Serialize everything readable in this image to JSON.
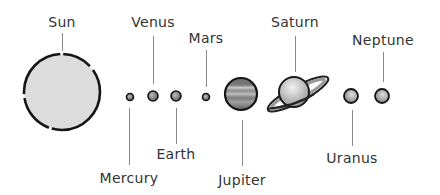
{
  "diagram": {
    "title": "",
    "planets": [
      {
        "id": "sun",
        "label": "Sun",
        "cx": 62,
        "cy": 92,
        "r": 38,
        "fill": "#dcdcdc",
        "label_pos": "top",
        "label_x": 62,
        "label_y": 14,
        "line_y1": 33,
        "line_y2": 51
      },
      {
        "id": "mercury",
        "label": "Mercury",
        "cx": 130,
        "cy": 97,
        "r": 3.5,
        "fill": "#777777",
        "label_pos": "bottom",
        "label_x": 129,
        "label_y": 170,
        "line_y1": 108,
        "line_y2": 165
      },
      {
        "id": "venus",
        "label": "Venus",
        "cx": 153,
        "cy": 96,
        "r": 5,
        "fill": "#666666",
        "label_pos": "top",
        "label_x": 153,
        "label_y": 14,
        "line_y1": 36,
        "line_y2": 84
      },
      {
        "id": "earth",
        "label": "Earth",
        "cx": 176,
        "cy": 96,
        "r": 5,
        "fill": "#6a6a6a",
        "label_pos": "bottom",
        "label_x": 176,
        "label_y": 146,
        "line_y1": 108,
        "line_y2": 144
      },
      {
        "id": "mars",
        "label": "Mars",
        "cx": 206,
        "cy": 97,
        "r": 3.5,
        "fill": "#888888",
        "label_pos": "top",
        "label_x": 206,
        "label_y": 30,
        "line_y1": 50,
        "line_y2": 87
      },
      {
        "id": "jupiter",
        "label": "Jupiter",
        "cx": 241,
        "cy": 94,
        "r": 16,
        "fill": "#8a8a8a",
        "label_pos": "bottom",
        "label_x": 242,
        "label_y": 172,
        "line_y1": 120,
        "line_y2": 166
      },
      {
        "id": "saturn",
        "label": "Saturn",
        "cx": 294,
        "cy": 92,
        "r": 15,
        "fill": "#b5b5b5",
        "label_pos": "top",
        "label_x": 295,
        "label_y": 14,
        "line_y1": 36,
        "line_y2": 72
      },
      {
        "id": "uranus",
        "label": "Uranus",
        "cx": 351,
        "cy": 96,
        "r": 7,
        "fill": "#8f8f8f",
        "label_pos": "bottom",
        "label_x": 352,
        "label_y": 150,
        "line_y1": 110,
        "line_y2": 146
      },
      {
        "id": "neptune",
        "label": "Neptune",
        "cx": 382,
        "cy": 96,
        "r": 7,
        "fill": "#9a9a9a",
        "label_pos": "top",
        "label_x": 383,
        "label_y": 32,
        "line_y1": 52,
        "line_y2": 82
      }
    ]
  }
}
